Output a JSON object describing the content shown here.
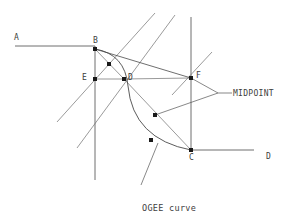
{
  "figure": {
    "title": "OGEE curve unequal arcs",
    "caption_line1": "OGEE curve",
    "caption_line2": "unequal arcs",
    "annotation": "MIDPOINT",
    "ink_color": "#4a4a4a",
    "node_color": "#1a1a1a",
    "background": "#ffffff"
  },
  "points": [
    {
      "id": "A",
      "label": "A",
      "x": 15,
      "y": 43,
      "has_dot": false,
      "label_x": 14,
      "label_y": 33
    },
    {
      "id": "B",
      "label": "B",
      "x": 95,
      "y": 49,
      "has_dot": true,
      "label_x": 93,
      "label_y": 36
    },
    {
      "id": "E",
      "label": "E",
      "x": 95,
      "y": 79,
      "has_dot": true,
      "label_x": 82,
      "label_y": 73
    },
    {
      "id": "D",
      "label": "D",
      "x": 124,
      "y": 79,
      "has_dot": true,
      "label_x": 128,
      "label_y": 73
    },
    {
      "id": "F",
      "label": "F",
      "x": 191,
      "y": 78,
      "has_dot": true,
      "label_x": 196,
      "label_y": 71
    },
    {
      "id": "C",
      "label": "C",
      "x": 191,
      "y": 150,
      "has_dot": true,
      "label_x": 189,
      "label_y": 153
    },
    {
      "id": "D2",
      "label": "D",
      "x": 254,
      "y": 150,
      "has_dot": false,
      "label_x": 266,
      "label_y": 152
    },
    {
      "id": "M1",
      "label": "",
      "x": 109,
      "y": 64,
      "has_dot": true,
      "label_x": 0,
      "label_y": 0
    },
    {
      "id": "M2",
      "label": "",
      "x": 155,
      "y": 115,
      "has_dot": true,
      "label_x": 0,
      "label_y": 0
    },
    {
      "id": "M3",
      "label": "",
      "x": 151,
      "y": 140,
      "has_dot": true,
      "label_x": 0,
      "label_y": 0
    }
  ],
  "lines": [
    {
      "name": "baseline-A-B",
      "x1": 15,
      "y1": 46,
      "x2": 95,
      "y2": 46,
      "kind": "geom"
    },
    {
      "name": "baseline-C-D",
      "x1": 191,
      "y1": 150,
      "x2": 254,
      "y2": 150,
      "kind": "geom"
    },
    {
      "name": "vertical-through-B-E",
      "x1": 95,
      "y1": 46,
      "x2": 95,
      "y2": 180,
      "kind": "geom"
    },
    {
      "name": "vertical-through-F-C",
      "x1": 191,
      "y1": 17,
      "x2": 191,
      "y2": 150,
      "kind": "geom"
    },
    {
      "name": "diagonal-upper-right-1",
      "x1": 57,
      "y1": 122,
      "x2": 155,
      "y2": 13,
      "kind": "thin"
    },
    {
      "name": "diagonal-upper-right-2",
      "x1": 77,
      "y1": 148,
      "x2": 175,
      "y2": 15,
      "kind": "thin"
    },
    {
      "name": "diagonal-short-near-F",
      "x1": 172,
      "y1": 95,
      "x2": 212,
      "y2": 52,
      "kind": "thin"
    },
    {
      "name": "chord-B-F",
      "x1": 95,
      "y1": 49,
      "x2": 191,
      "y2": 78,
      "kind": "geom"
    },
    {
      "name": "chord-D-F",
      "x1": 124,
      "y1": 79,
      "x2": 191,
      "y2": 78,
      "kind": "thin"
    },
    {
      "name": "chord-D-C",
      "x1": 124,
      "y1": 79,
      "x2": 191,
      "y2": 150,
      "kind": "thin"
    },
    {
      "name": "chord-B-D",
      "x1": 95,
      "y1": 49,
      "x2": 124,
      "y2": 79,
      "kind": "thin"
    },
    {
      "name": "chord-E-D",
      "x1": 95,
      "y1": 79,
      "x2": 124,
      "y2": 79,
      "kind": "thin"
    }
  ],
  "curves": [
    {
      "name": "ogee-upper-arc",
      "path": "M 95 49 Q 125 54 128 86",
      "kind": "curve"
    },
    {
      "name": "ogee-lower-arc",
      "path": "M 128 86 Q 133 139 191 150",
      "kind": "curve"
    }
  ],
  "leaders": [
    {
      "name": "midpoint-leader-upper",
      "x1": 191,
      "y1": 78,
      "x2": 218,
      "y2": 93
    },
    {
      "name": "midpoint-leader-lower",
      "x1": 155,
      "y1": 115,
      "x2": 218,
      "y2": 93
    },
    {
      "name": "midpoint-leader-stem",
      "x1": 218,
      "y1": 93,
      "x2": 232,
      "y2": 93
    },
    {
      "name": "caption-leader",
      "x1": 141,
      "y1": 185,
      "x2": 158,
      "y2": 143
    }
  ],
  "annotation_pos": {
    "x": 233,
    "y": 89
  },
  "caption_pos": {
    "x": 142,
    "y": 181
  }
}
